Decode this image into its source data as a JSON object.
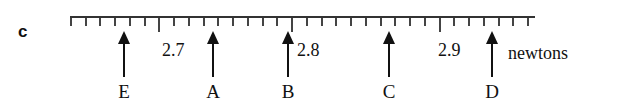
{
  "figure": {
    "part_label": "c",
    "unit_label": "newtons"
  },
  "chart_data": {
    "type": "scatter",
    "title": "",
    "xlabel": "newtons",
    "ylabel": "",
    "xlim": [
      2.645,
      2.955
    ],
    "grid": false,
    "legend": null,
    "axis": {
      "tick_labels": [
        "2.7",
        "2.8",
        "2.9"
      ],
      "tick_values": [
        2.7,
        2.8,
        2.9
      ],
      "minor_tick_step": 0.01,
      "major_tick_step": 0.1
    },
    "categories": [
      "E",
      "A",
      "B",
      "C",
      "D"
    ],
    "values": [
      2.682,
      2.742,
      2.795,
      2.864,
      2.934
    ],
    "points": [
      {
        "label": "E",
        "value": "2.682",
        "x_px": 124
      },
      {
        "label": "A",
        "value": "2.742",
        "x_px": 213
      },
      {
        "label": "B",
        "value": "2.795",
        "x_px": 288
      },
      {
        "label": "C",
        "value": "2.864",
        "x_px": 389
      },
      {
        "label": "D",
        "value": "2.934",
        "x_px": 492
      }
    ],
    "annotations": [
      {
        "text": "2.7",
        "x_px": 162
      },
      {
        "text": "2.8",
        "x_px": 297
      },
      {
        "text": "2.9",
        "x_px": 438
      },
      {
        "text": "newtons",
        "x_px": 508
      }
    ]
  }
}
